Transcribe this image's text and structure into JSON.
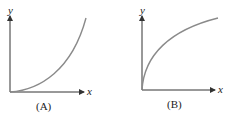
{
  "figures": [
    {
      "id": "A",
      "caption": "(A)",
      "x_axis_label": "x",
      "y_axis_label": "y",
      "curve": "increasing, concave up (e.g. y = x^2)",
      "curve_color": "#8a8a8a"
    },
    {
      "id": "B",
      "caption": "(B)",
      "x_axis_label": "x",
      "y_axis_label": "y",
      "curve": "increasing, concave down (e.g. y = sqrt(x))",
      "curve_color": "#8a8a8a"
    }
  ],
  "colors": {
    "axis": "#333333",
    "curve": "#8a8a8a",
    "background": "#ffffff"
  }
}
